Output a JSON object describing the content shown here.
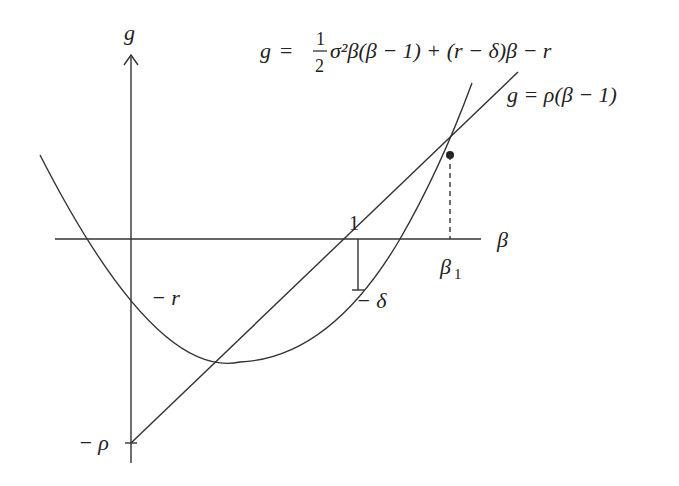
{
  "diagram": {
    "axes": {
      "y_label": "g",
      "x_label": "β"
    },
    "curves": {
      "parabola_label": {
        "lhs": "g",
        "eq": "=",
        "frac_num": "1",
        "frac_den": "2",
        "rhs": "σ²β(β − 1) + (r − δ)β − r"
      },
      "line_label": "g = ρ(β − 1)"
    },
    "annotations": {
      "one": "1",
      "beta1": "β",
      "beta1_sub": "1",
      "minus_r": "− r",
      "minus_delta": "− δ",
      "minus_rho": "− ρ"
    },
    "colors": {
      "ink": "#333333",
      "background": "#ffffff"
    }
  }
}
